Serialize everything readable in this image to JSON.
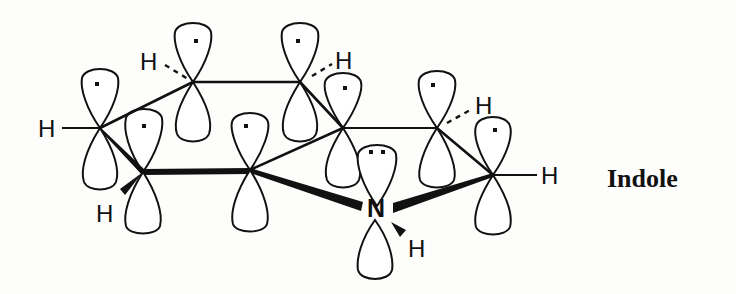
{
  "diagram": {
    "title": "Indole",
    "atom_labels": {
      "h_c1": "H",
      "h_c2": "H",
      "h_c3": "H",
      "h_c5": "H",
      "h_c7": "H",
      "h_c8": "H",
      "nitrogen": "N",
      "h_n": "H"
    },
    "orbitals": [
      {
        "atom": "C1",
        "x": 100,
        "y": 128,
        "electrons": 1
      },
      {
        "atom": "C2",
        "x": 143,
        "y": 172,
        "electrons": 1
      },
      {
        "atom": "C3",
        "x": 193,
        "y": 82,
        "electrons": 1
      },
      {
        "atom": "C4",
        "x": 300,
        "y": 82,
        "electrons": 1
      },
      {
        "atom": "C5",
        "x": 343,
        "y": 128,
        "electrons": 1
      },
      {
        "atom": "C6",
        "x": 250,
        "y": 170,
        "electrons": 1
      },
      {
        "atom": "C7",
        "x": 437,
        "y": 128,
        "electrons": 1
      },
      {
        "atom": "C8",
        "x": 493,
        "y": 175,
        "electrons": 1
      },
      {
        "atom": "N",
        "x": 377,
        "y": 208,
        "electrons": 2
      }
    ]
  }
}
